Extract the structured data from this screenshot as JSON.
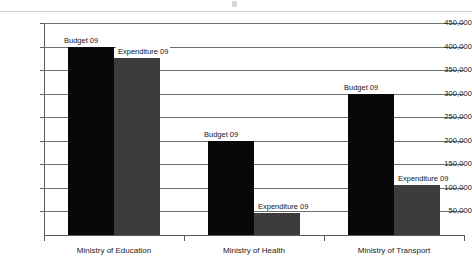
{
  "chart_data": {
    "type": "bar",
    "title": "",
    "xlabel": "",
    "ylabel": "",
    "ylim": [
      0,
      450000
    ],
    "ytick_interval": 50000,
    "grid": true,
    "legend_position": "none",
    "categories": [
      "Ministry of Education",
      "Ministry of Health",
      "Ministry of Transport"
    ],
    "ytick_labels": [
      "450,000",
      "400,000",
      "350,000",
      "300,000",
      "250,000",
      "200,000",
      "150,000",
      "100,000",
      "50,000"
    ],
    "ytick_values": [
      450000,
      400000,
      350000,
      300000,
      250000,
      200000,
      150000,
      100000,
      50000
    ],
    "series": [
      {
        "name": "Budget 09",
        "color": "#080808",
        "values": [
          400000,
          200000,
          300000
        ],
        "point_labels": [
          "Budget 09",
          "Budget 09",
          "Budget 09"
        ]
      },
      {
        "name": "Expenditure 09",
        "color": "#3c3c3c",
        "values": [
          375000,
          47000,
          107000
        ],
        "point_labels": [
          "Expenditure 09",
          "Expenditure 09",
          "Expenditure 09"
        ]
      }
    ]
  }
}
